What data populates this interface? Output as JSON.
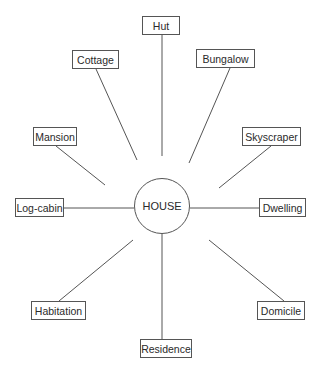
{
  "diagram": {
    "type": "spider-diagram",
    "center": {
      "label": "HOUSE",
      "cx": 162,
      "cy": 206,
      "r": 28
    },
    "nodes": [
      {
        "id": "hut",
        "label": "Hut",
        "box": [
          142,
          16,
          38,
          19
        ],
        "line": [
          162,
          35,
          162,
          156
        ]
      },
      {
        "id": "cottage",
        "label": "Cottage",
        "box": [
          72,
          50,
          47,
          19
        ],
        "line": [
          96,
          69,
          137,
          160
        ]
      },
      {
        "id": "bungalow",
        "label": "Bungalow",
        "box": [
          196,
          49,
          59,
          19
        ],
        "line": [
          230,
          68,
          189,
          163
        ]
      },
      {
        "id": "mansion",
        "label": "Mansion",
        "box": [
          33,
          127,
          44,
          19
        ],
        "line": [
          56,
          146,
          105,
          185
        ]
      },
      {
        "id": "skyscraper",
        "label": "Skyscraper",
        "box": [
          242,
          127,
          59,
          19
        ],
        "line": [
          271,
          146,
          219,
          188
        ]
      },
      {
        "id": "log-cabin",
        "label": "Log-cabin",
        "box": [
          15,
          198,
          49,
          19
        ],
        "line": [
          63,
          208,
          134,
          208
        ]
      },
      {
        "id": "dwelling",
        "label": "Dwelling",
        "box": [
          259,
          198,
          47,
          19
        ],
        "line": [
          190,
          208,
          259,
          208
        ]
      },
      {
        "id": "habitation",
        "label": "Habitation",
        "box": [
          31,
          301,
          55,
          19
        ],
        "line": [
          59,
          301,
          133,
          240
        ]
      },
      {
        "id": "domicile",
        "label": "Domicile",
        "box": [
          257,
          301,
          48,
          19
        ],
        "line": [
          284,
          301,
          209,
          240
        ]
      },
      {
        "id": "residence",
        "label": "Residence",
        "box": [
          140,
          339,
          52,
          19
        ],
        "line": [
          162,
          234,
          162,
          339
        ]
      }
    ]
  },
  "colors": {
    "line": "#555555",
    "text": "#2a2a2a",
    "background": "#ffffff"
  }
}
